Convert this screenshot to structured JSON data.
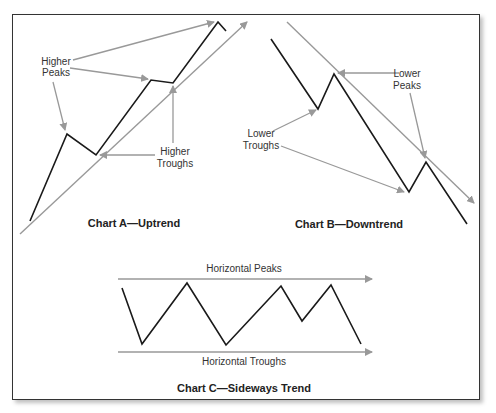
{
  "colors": {
    "price_line": "#1a1a1a",
    "annotation": "#999999",
    "frame": "#333333"
  },
  "chart_a": {
    "title": "Chart A—Uptrend",
    "peaks_label_line1": "Higher",
    "peaks_label_line2": "Peaks",
    "troughs_label_line1": "Higher",
    "troughs_label_line2": "Troughs"
  },
  "chart_b": {
    "title": "Chart B—Downtrend",
    "peaks_label_line1": "Lower",
    "peaks_label_line2": "Peaks",
    "troughs_label_line1": "Lower",
    "troughs_label_line2": "Troughs"
  },
  "chart_c": {
    "title": "Chart C—Sideways Trend",
    "peaks_label": "Horizontal Peaks",
    "troughs_label": "Horizontal Troughs"
  }
}
